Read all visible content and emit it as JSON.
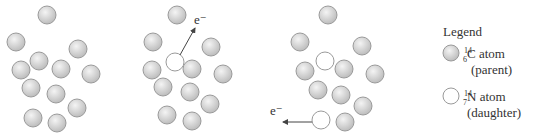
{
  "colors": {
    "parent_fill": "#d4d4d4",
    "daughter_fill": "#ffffff",
    "stroke": "#9a9a9a",
    "text": "#333333"
  },
  "atom_radius": 9,
  "panels": [
    {
      "name": "panel-1",
      "atoms": [
        {
          "x": 47,
          "y": 15,
          "type": "parent"
        },
        {
          "x": 16,
          "y": 42,
          "type": "parent"
        },
        {
          "x": 78,
          "y": 49,
          "type": "parent"
        },
        {
          "x": 39,
          "y": 61,
          "type": "parent"
        },
        {
          "x": 21,
          "y": 70,
          "type": "parent"
        },
        {
          "x": 61,
          "y": 69,
          "type": "parent"
        },
        {
          "x": 91,
          "y": 74,
          "type": "parent"
        },
        {
          "x": 31,
          "y": 88,
          "type": "parent"
        },
        {
          "x": 56,
          "y": 94,
          "type": "parent"
        },
        {
          "x": 77,
          "y": 108,
          "type": "parent"
        },
        {
          "x": 33,
          "y": 118,
          "type": "parent"
        },
        {
          "x": 57,
          "y": 123,
          "type": "parent"
        }
      ]
    },
    {
      "name": "panel-2",
      "electron": {
        "label": "e⁻",
        "x1": 180,
        "y1": 55,
        "x2": 195,
        "y2": 28,
        "lx": 194,
        "ly": 24
      },
      "atoms": [
        {
          "x": 177,
          "y": 15,
          "type": "parent"
        },
        {
          "x": 153,
          "y": 42,
          "type": "parent"
        },
        {
          "x": 211,
          "y": 47,
          "type": "parent"
        },
        {
          "x": 175,
          "y": 62,
          "type": "daughter"
        },
        {
          "x": 152,
          "y": 70,
          "type": "parent"
        },
        {
          "x": 192,
          "y": 69,
          "type": "parent"
        },
        {
          "x": 223,
          "y": 74,
          "type": "parent"
        },
        {
          "x": 163,
          "y": 87,
          "type": "parent"
        },
        {
          "x": 190,
          "y": 92,
          "type": "parent"
        },
        {
          "x": 210,
          "y": 104,
          "type": "parent"
        },
        {
          "x": 167,
          "y": 115,
          "type": "parent"
        },
        {
          "x": 192,
          "y": 121,
          "type": "parent"
        }
      ]
    },
    {
      "name": "panel-3",
      "electron": {
        "label": "e⁻",
        "x1": 312,
        "y1": 122,
        "x2": 283,
        "y2": 122,
        "lx": 270,
        "ly": 115
      },
      "atoms": [
        {
          "x": 328,
          "y": 15,
          "type": "parent"
        },
        {
          "x": 300,
          "y": 42,
          "type": "parent"
        },
        {
          "x": 362,
          "y": 46,
          "type": "parent"
        },
        {
          "x": 325,
          "y": 61,
          "type": "daughter"
        },
        {
          "x": 305,
          "y": 71,
          "type": "parent"
        },
        {
          "x": 344,
          "y": 69,
          "type": "parent"
        },
        {
          "x": 375,
          "y": 74,
          "type": "parent"
        },
        {
          "x": 318,
          "y": 90,
          "type": "parent"
        },
        {
          "x": 341,
          "y": 95,
          "type": "parent"
        },
        {
          "x": 363,
          "y": 106,
          "type": "parent"
        },
        {
          "x": 321,
          "y": 120,
          "type": "daughter"
        },
        {
          "x": 345,
          "y": 122,
          "type": "parent"
        }
      ]
    }
  ],
  "legend": {
    "title": "Legend",
    "items": [
      {
        "type": "parent",
        "mass": "14",
        "atomic": "6",
        "symbol": "C atom",
        "role": "(parent)"
      },
      {
        "type": "daughter",
        "mass": "14",
        "atomic": "7",
        "symbol": "N atom",
        "role": "(daughter)"
      }
    ]
  }
}
